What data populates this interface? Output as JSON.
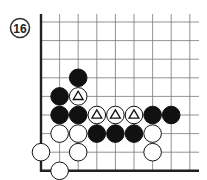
{
  "problem": {
    "number": "16"
  },
  "board": {
    "origin_x": 41,
    "origin_y": 22,
    "spacing": 18.6,
    "cols": 9,
    "rows": 9,
    "right_extent": 199,
    "line_color": "#777777",
    "edge_color": "#222222",
    "edges": [
      "left",
      "bottom"
    ]
  },
  "stones": [
    {
      "color": "black",
      "col": 2,
      "row": 3,
      "mark": ""
    },
    {
      "color": "black",
      "col": 1,
      "row": 4,
      "mark": ""
    },
    {
      "color": "white",
      "col": 2,
      "row": 4,
      "mark": "triangle"
    },
    {
      "color": "black",
      "col": 1,
      "row": 5,
      "mark": ""
    },
    {
      "color": "black",
      "col": 2,
      "row": 5,
      "mark": ""
    },
    {
      "color": "white",
      "col": 3,
      "row": 5,
      "mark": "triangle"
    },
    {
      "color": "white",
      "col": 4,
      "row": 5,
      "mark": "triangle"
    },
    {
      "color": "white",
      "col": 5,
      "row": 5,
      "mark": "triangle"
    },
    {
      "color": "black",
      "col": 6,
      "row": 5,
      "mark": ""
    },
    {
      "color": "black",
      "col": 7,
      "row": 5,
      "mark": ""
    },
    {
      "color": "white",
      "col": 1,
      "row": 6,
      "mark": ""
    },
    {
      "color": "white",
      "col": 2,
      "row": 6,
      "mark": ""
    },
    {
      "color": "black",
      "col": 3,
      "row": 6,
      "mark": ""
    },
    {
      "color": "black",
      "col": 4,
      "row": 6,
      "mark": ""
    },
    {
      "color": "black",
      "col": 5,
      "row": 6,
      "mark": ""
    },
    {
      "color": "white",
      "col": 6,
      "row": 6,
      "mark": ""
    },
    {
      "color": "white",
      "col": 0,
      "row": 7,
      "mark": ""
    },
    {
      "color": "white",
      "col": 2,
      "row": 7,
      "mark": ""
    },
    {
      "color": "white",
      "col": 6,
      "row": 7,
      "mark": ""
    },
    {
      "color": "white",
      "col": 1,
      "row": 8,
      "mark": ""
    }
  ]
}
